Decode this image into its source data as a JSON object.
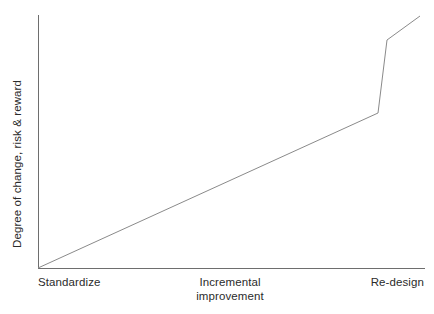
{
  "chart_data": {
    "type": "line",
    "title": "",
    "subtitle": "",
    "xlabel": "",
    "ylabel": "Degree of change, risk & reward",
    "x_tick_labels": [
      "Standardize",
      "Incremental improvement",
      "Re-design"
    ],
    "x_tick_label_lines": [
      [
        "Standardize"
      ],
      [
        "Incremental",
        "improvement"
      ],
      [
        "Re-design"
      ]
    ],
    "y_tick_labels": [],
    "grid": false,
    "legend": null,
    "legend_position": "none",
    "xlim": [
      0,
      100
    ],
    "ylim": [
      0,
      100
    ],
    "axis_color": "#6e6e6e",
    "line_color": "#8a8a8a",
    "background_color": "#ffffff",
    "text_color": "#2b2b2b",
    "annotations": [],
    "series": [
      {
        "name": "Degree of change, risk & reward",
        "comment": "Schematic curve: gradual linear rise across standardize to incremental improvement, then a steep step jump at re-design followed by a shallower continued rise.",
        "x": [
          0,
          87.8,
          90.2,
          98.7
        ],
        "y": [
          0,
          61.3,
          90.1,
          99.6
        ],
        "pixel_points": [
          [
            38,
            268
          ],
          [
            378,
            113
          ],
          [
            387,
            40
          ],
          [
            420,
            16
          ]
        ]
      }
    ],
    "axes_pixel_geometry": {
      "y_axis": {
        "x": 38,
        "y_top": 15,
        "y_bottom": 268
      },
      "x_axis": {
        "y": 268,
        "x_left": 38,
        "x_right": 425
      }
    }
  },
  "figure": {
    "ylabel": "Degree of change, risk & reward",
    "ticks": {
      "left": "Standardize",
      "center_line1": "Incremental",
      "center_line2": "improvement",
      "right": "Re-design"
    }
  }
}
